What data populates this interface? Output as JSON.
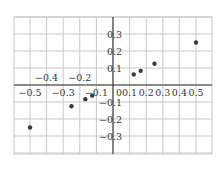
{
  "chart_data": {
    "type": "scatter",
    "title": "",
    "xlabel": "",
    "ylabel": "",
    "xlim": [
      -0.58,
      0.6
    ],
    "ylim": [
      -0.4,
      0.4
    ],
    "grid": true,
    "legend": null,
    "x_ticks": [
      -0.5,
      -0.4,
      -0.3,
      -0.2,
      -0.1,
      0,
      0.1,
      0.2,
      0.3,
      0.4,
      0.5
    ],
    "x_tick_labels": [
      "−0.5",
      "−0.4",
      "−0.3",
      "−0.2",
      "−0.1",
      "0",
      "0.1",
      "0.2",
      "0.3",
      "0.4",
      "0.5"
    ],
    "y_ticks": [
      0.3,
      0.2,
      0.1,
      -0.1,
      -0.2,
      -0.3
    ],
    "y_tick_labels": [
      "0.3",
      "0.2",
      "0.1",
      "−0.1",
      "−0.2",
      "−0.3"
    ],
    "series": [
      {
        "name": "points",
        "x": [
          -0.5,
          -0.25,
          -0.1667,
          -0.125,
          0.125,
          0.1667,
          0.25,
          0.5
        ],
        "y": [
          -0.25,
          -0.125,
          -0.0833,
          -0.0625,
          0.0625,
          0.0833,
          0.125,
          0.25
        ]
      }
    ]
  },
  "colors": {
    "grid": "#c8c8c8",
    "axis": "#333333",
    "point": "#3a3a3a",
    "text": "#333333"
  }
}
